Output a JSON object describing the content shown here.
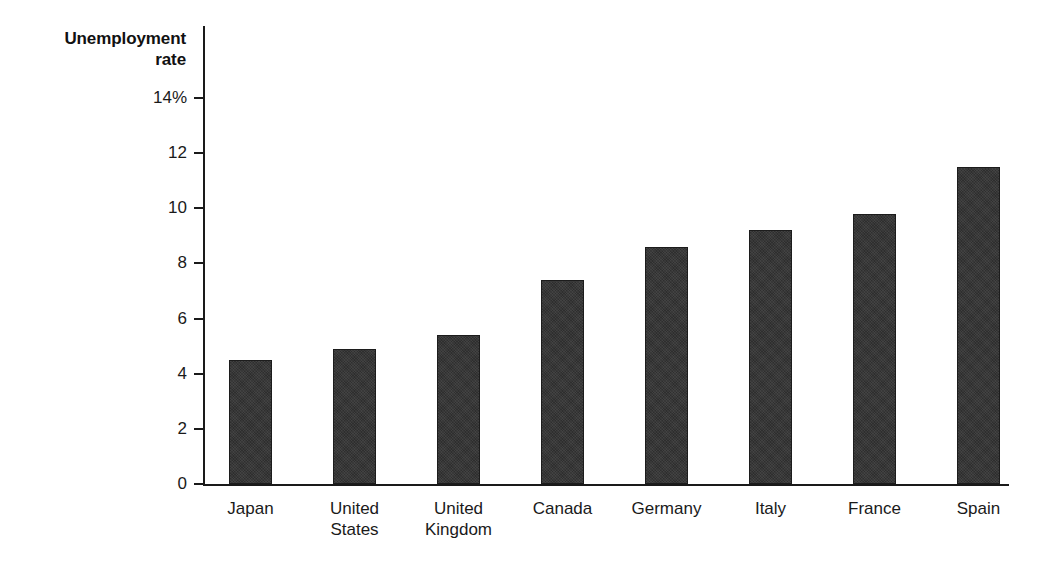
{
  "chart_data": {
    "type": "bar",
    "title": "",
    "subtitle": "",
    "xlabel": "",
    "ylabel": "Unemployment rate",
    "categories": [
      "Japan",
      "United States",
      "United Kingdom",
      "Canada",
      "Germany",
      "Italy",
      "France",
      "Spain"
    ],
    "category_lines": [
      [
        "Japan"
      ],
      [
        "United",
        "States"
      ],
      [
        "United",
        "Kingdom"
      ],
      [
        "Canada"
      ],
      [
        "Germany"
      ],
      [
        "Italy"
      ],
      [
        "France"
      ],
      [
        "Spain"
      ]
    ],
    "values": [
      4.5,
      4.9,
      5.4,
      7.4,
      8.6,
      9.2,
      9.8,
      11.5
    ],
    "unit": "%",
    "ylim": [
      0,
      14
    ],
    "yticks": [
      0,
      2,
      4,
      6,
      8,
      10,
      12,
      14
    ],
    "ytick_labels": [
      "0",
      "2",
      "4",
      "6",
      "8",
      "10",
      "12",
      "14%"
    ],
    "grid": false,
    "legend": false,
    "bar_color": "#2e2e2e",
    "axis_color": "#1a1a1a",
    "background": "#ffffff"
  },
  "axis_title": {
    "line1": "Unemployment",
    "line2": "rate"
  }
}
